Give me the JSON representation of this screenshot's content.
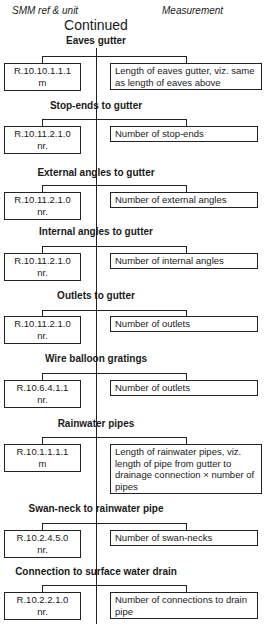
{
  "header": {
    "col_left": "SMM ref & unit",
    "col_right": "Measurement",
    "continued": "Continued"
  },
  "sections": [
    {
      "title": "Eaves gutter",
      "ref": "R.10.10.1.1.1",
      "unit": "m",
      "measurement": "Length of eaves gutter, viz. same as length of eaves above"
    },
    {
      "title": "Stop-ends to gutter",
      "ref": "R.10.11.2.1.0",
      "unit": "nr.",
      "measurement": "Number of stop-ends"
    },
    {
      "title": "External angles to gutter",
      "ref": "R.10.11.2.1.0",
      "unit": "nr.",
      "measurement": "Number of external angles"
    },
    {
      "title": "Internal angles to gutter",
      "ref": "R.10.11.2.1.0",
      "unit": "nr.",
      "measurement": "Number of internal angles"
    },
    {
      "title": "Outlets to gutter",
      "ref": "R.10.11.2.1.0",
      "unit": "nr.",
      "measurement": "Number of outlets"
    },
    {
      "title": "Wire balloon gratings",
      "ref": "R.10.6.4.1.1",
      "unit": "nr.",
      "measurement": "Number of outlets"
    },
    {
      "title": "Rainwater pipes",
      "ref": "R.10.1.1.1.1",
      "unit": "m",
      "measurement": "Length of rainwater pipes, viz. length of pipe from gutter to drainage connection × number of pipes"
    },
    {
      "title": "Swan-neck to rainwater pipe",
      "ref": "R.10.2.4.5.0",
      "unit": "nr.",
      "measurement": "Number of swan-necks"
    },
    {
      "title": "Connection to surface water drain",
      "ref": "R.10.2.2.1.0",
      "unit": "nr.",
      "measurement": "Number of connections to drain pipe"
    }
  ]
}
